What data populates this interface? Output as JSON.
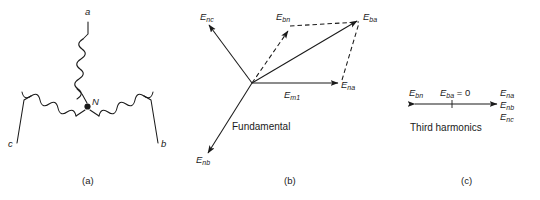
{
  "figure": {
    "width": 540,
    "height": 200,
    "background": "#ffffff",
    "line_color": "#1a1a1a",
    "text_color": "#1a1a1a"
  },
  "panel_a": {
    "caption": "(a)",
    "type": "wye-connected-three-phase-winding",
    "neutral_label": "N",
    "terminals": [
      {
        "id": "a",
        "label": "a",
        "position": "top"
      },
      {
        "id": "b",
        "label": "b",
        "position": "bottom-right"
      },
      {
        "id": "c",
        "label": "c",
        "position": "bottom-left"
      }
    ]
  },
  "panel_b": {
    "caption": "(b)",
    "title": "Fundamental",
    "vectors": [
      {
        "name": "E_nc",
        "base": "E",
        "sub": "nc",
        "style": "solid",
        "direction": "up-left"
      },
      {
        "name": "E_nb",
        "base": "E",
        "sub": "nb",
        "style": "solid",
        "direction": "down-left"
      },
      {
        "name": "E_na",
        "base": "E",
        "sub": "na",
        "style": "solid",
        "direction": "right"
      },
      {
        "name": "E_bn",
        "base": "E",
        "sub": "bn",
        "style": "dashed",
        "direction": "up-right"
      },
      {
        "name": "E_ba",
        "base": "E",
        "sub": "ba",
        "style": "solid",
        "direction": "up-right-resultant"
      },
      {
        "name": "E_m1",
        "base": "E",
        "sub": "m1",
        "style": "label-only",
        "direction": "right"
      }
    ]
  },
  "panel_c": {
    "caption": "(c)",
    "title": "Third harmonics",
    "left_label": {
      "base": "E",
      "sub": "bn"
    },
    "center_label": {
      "base": "E",
      "sub": "ba",
      "equals": " = 0"
    },
    "right_labels": [
      {
        "base": "E",
        "sub": "na"
      },
      {
        "base": "E",
        "sub": "nb"
      },
      {
        "base": "E",
        "sub": "nc"
      }
    ]
  }
}
